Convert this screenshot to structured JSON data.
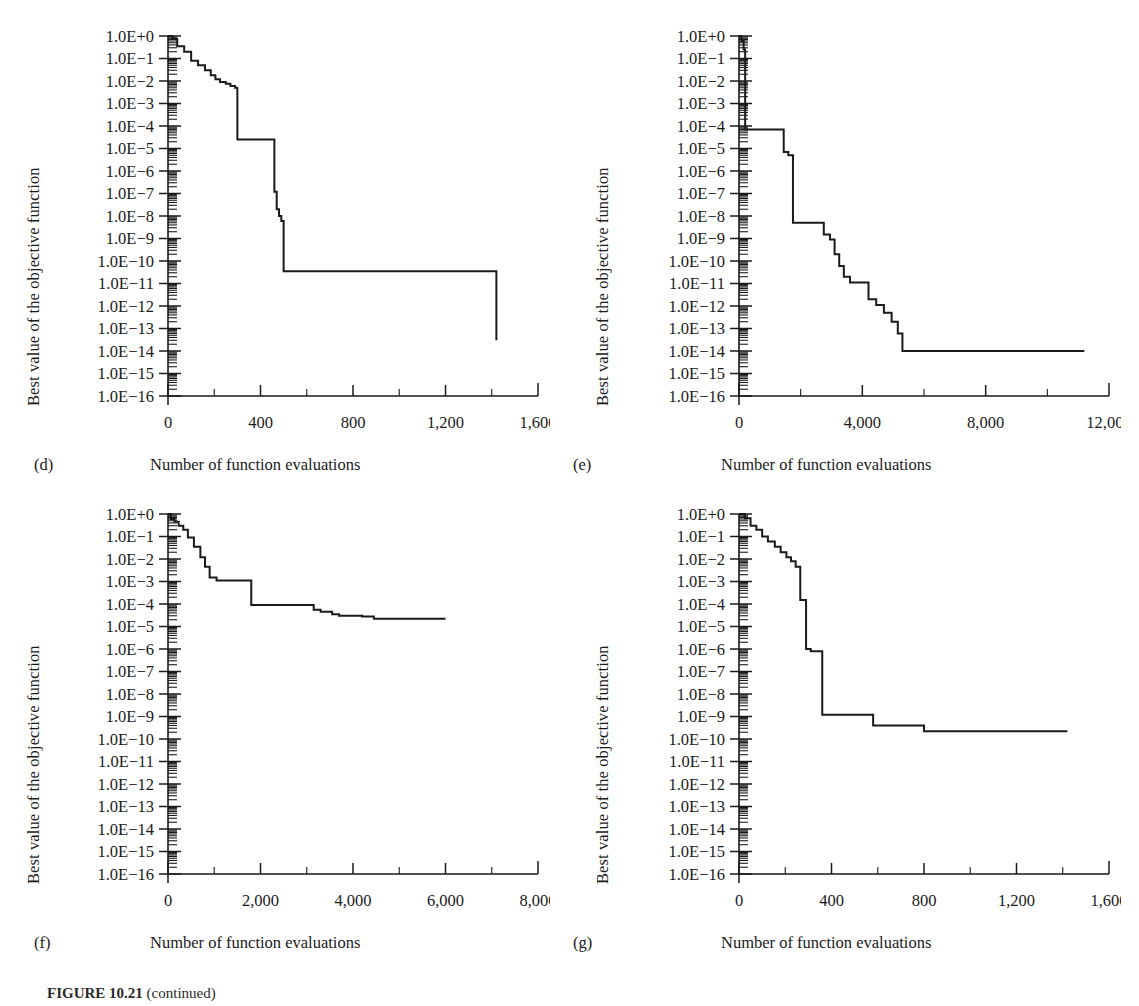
{
  "figure": {
    "caption_label": "FIGURE 10.21",
    "caption_text": "(continued)"
  },
  "axis_titles": {
    "y": "Best value of the objective function",
    "x": "Number of function evaluations"
  },
  "y_tick_labels": [
    "1.0E+0",
    "1.0E−1",
    "1.0E−2",
    "1.0E−3",
    "1.0E−4",
    "1.0E−5",
    "1.0E−6",
    "1.0E−7",
    "1.0E−8",
    "1.0E−9",
    "1.0E−10",
    "1.0E−11",
    "1.0E−12",
    "1.0E−13",
    "1.0E−14",
    "1.0E−15",
    "1.0E−16"
  ],
  "panels": [
    {
      "tag": "(d)",
      "key": "d"
    },
    {
      "tag": "(e)",
      "key": "e"
    },
    {
      "tag": "(f)",
      "key": "f"
    },
    {
      "tag": "(g)",
      "key": "g"
    }
  ],
  "chart_data": [
    {
      "type": "line",
      "panel": "(d)",
      "title": "",
      "xlabel": "Number of function evaluations",
      "ylabel": "Best value of the objective function",
      "yscale": "log",
      "ylim": [
        1e-16,
        1
      ],
      "xlim": [
        0,
        1600
      ],
      "xticks": [
        0,
        400,
        800,
        1200,
        1600
      ],
      "xtick_labels": [
        "0",
        "400",
        "800",
        "1,200",
        "1,600"
      ],
      "yticks_exponents": [
        0,
        -1,
        -2,
        -3,
        -4,
        -5,
        -6,
        -7,
        -8,
        -9,
        -10,
        -11,
        -12,
        -13,
        -14,
        -15,
        -16
      ],
      "grid": false,
      "legend": "none",
      "step": "post",
      "x": [
        0,
        20,
        40,
        70,
        100,
        130,
        160,
        185,
        205,
        225,
        250,
        270,
        290,
        300,
        450,
        460,
        470,
        480,
        490,
        500,
        710,
        1420
      ],
      "y": [
        1.0,
        0.75,
        0.35,
        0.2,
        0.08,
        0.05,
        0.03,
        0.018,
        0.012,
        0.009,
        0.0075,
        0.006,
        0.005,
        2.5e-05,
        2.5e-05,
        1.2e-07,
        2e-08,
        1e-08,
        6e-09,
        3.5e-11,
        3.5e-11,
        3e-14
      ]
    },
    {
      "type": "line",
      "panel": "(e)",
      "title": "",
      "xlabel": "Number of function evaluations",
      "ylabel": "Best value of the objective function",
      "yscale": "log",
      "ylim": [
        1e-16,
        1
      ],
      "xlim": [
        0,
        12000
      ],
      "xticks": [
        0,
        4000,
        8000,
        12000
      ],
      "xtick_labels": [
        "0",
        "4,000",
        "8,000",
        "12,000"
      ],
      "yticks_exponents": [
        0,
        -1,
        -2,
        -3,
        -4,
        -5,
        -6,
        -7,
        -8,
        -9,
        -10,
        -11,
        -12,
        -13,
        -14,
        -15,
        -16
      ],
      "grid": false,
      "legend": "none",
      "step": "post",
      "x": [
        0,
        80,
        150,
        200,
        1200,
        1450,
        1600,
        1750,
        2500,
        2750,
        2950,
        3100,
        3250,
        3400,
        3600,
        3900,
        4200,
        4450,
        4700,
        4950,
        5150,
        5300,
        11200
      ],
      "y": [
        1.0,
        0.6,
        0.25,
        7e-05,
        7e-05,
        7e-06,
        5e-06,
        5e-09,
        5e-09,
        1.5e-09,
        9e-10,
        2e-10,
        6e-11,
        2e-11,
        1.1e-11,
        1.1e-11,
        2e-12,
        1.1e-12,
        5e-13,
        2e-13,
        6e-14,
        1e-14,
        1e-14
      ]
    },
    {
      "type": "line",
      "panel": "(f)",
      "title": "",
      "xlabel": "Number of function evaluations",
      "ylabel": "Best value of the objective function",
      "yscale": "log",
      "ylim": [
        1e-16,
        1
      ],
      "xlim": [
        0,
        8000
      ],
      "xticks": [
        0,
        2000,
        4000,
        6000,
        8000
      ],
      "xtick_labels": [
        "0",
        "2,000",
        "4,000",
        "6,000",
        "8,000"
      ],
      "yticks_exponents": [
        0,
        -1,
        -2,
        -3,
        -4,
        -5,
        -6,
        -7,
        -8,
        -9,
        -10,
        -11,
        -12,
        -13,
        -14,
        -15,
        -16
      ],
      "grid": false,
      "legend": "none",
      "step": "post",
      "x": [
        0,
        60,
        140,
        230,
        330,
        430,
        560,
        700,
        800,
        900,
        1050,
        1700,
        1800,
        3000,
        3150,
        3300,
        3550,
        3700,
        4200,
        4450,
        6000
      ],
      "y": [
        1.0,
        0.6,
        0.45,
        0.3,
        0.2,
        0.09,
        0.035,
        0.012,
        0.0045,
        0.0015,
        0.0011,
        0.0011,
        9e-05,
        9e-05,
        5.5e-05,
        4.5e-05,
        3.5e-05,
        3e-05,
        2.8e-05,
        2.2e-05,
        2.2e-05
      ]
    },
    {
      "type": "line",
      "panel": "(g)",
      "title": "",
      "xlabel": "Number of function evaluations",
      "ylabel": "Best value of the objective function",
      "yscale": "log",
      "ylim": [
        1e-16,
        1
      ],
      "xlim": [
        0,
        1600
      ],
      "xticks": [
        0,
        400,
        800,
        1200,
        1600
      ],
      "xtick_labels": [
        "0",
        "400",
        "800",
        "1,200",
        "1,600"
      ],
      "yticks_exponents": [
        0,
        -1,
        -2,
        -3,
        -4,
        -5,
        -6,
        -7,
        -8,
        -9,
        -10,
        -11,
        -12,
        -13,
        -14,
        -15,
        -16
      ],
      "grid": false,
      "legend": "none",
      "step": "post",
      "x": [
        0,
        25,
        50,
        75,
        100,
        125,
        155,
        180,
        205,
        225,
        245,
        265,
        290,
        310,
        350,
        360,
        560,
        580,
        800,
        1420
      ],
      "y": [
        1.0,
        0.65,
        0.3,
        0.2,
        0.1,
        0.06,
        0.035,
        0.02,
        0.012,
        0.008,
        0.0045,
        0.00015,
        1e-06,
        8e-07,
        8e-07,
        1.2e-09,
        1.2e-09,
        4e-10,
        2.2e-10,
        2.2e-10
      ]
    }
  ]
}
